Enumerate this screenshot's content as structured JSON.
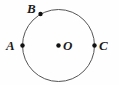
{
  "figure": {
    "type": "geometry-diagram",
    "background_color": "#fefefe",
    "stroke_color": "#555555",
    "point_color": "#111111",
    "label_color": "#1a1a1a",
    "canvas": {
      "width": 119,
      "height": 85
    },
    "circle": {
      "cx": 58.5,
      "cy": 45.5,
      "r": 36,
      "stroke_width": 1
    },
    "points": [
      {
        "id": "A",
        "label": "A",
        "x": 22.5,
        "y": 45.5,
        "r": 2.2,
        "label_x": 6,
        "label_y": 39
      },
      {
        "id": "B",
        "label": "B",
        "x": 40.5,
        "y": 14.0,
        "r": 2.2,
        "label_x": 27,
        "label_y": 2
      },
      {
        "id": "C",
        "label": "C",
        "x": 94.5,
        "y": 45.5,
        "r": 2.2,
        "label_x": 99,
        "label_y": 39
      },
      {
        "id": "O",
        "label": "O",
        "x": 58.5,
        "y": 45.5,
        "r": 2.2,
        "label_x": 63,
        "label_y": 39
      }
    ]
  }
}
